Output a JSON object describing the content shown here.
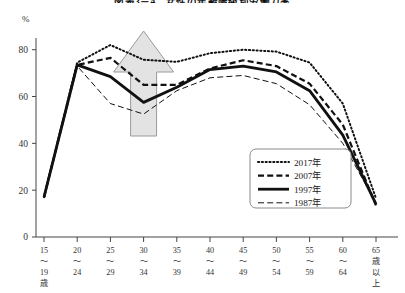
{
  "chart_data": {
    "type": "line",
    "title": "図表3－4　女性の年齢階級別労働力率",
    "ylabel": "%",
    "xlabel": "",
    "ylim": [
      0,
      85
    ],
    "yticks": [
      0,
      20,
      40,
      60,
      80
    ],
    "grid": false,
    "legend_position": "inside-bottom-right",
    "categories": [
      "15\n～\n19\n歳",
      "20\n～\n24",
      "25\n～\n29",
      "30\n～\n34",
      "35\n～\n39",
      "40\n～\n44",
      "45\n～\n49",
      "50\n～\n54",
      "55\n～\n59",
      "60\n～\n64",
      "65\n歳\n以\n上"
    ],
    "series": [
      {
        "name": "2017年",
        "style": "dotted",
        "values": [
          17.0,
          74.5,
          82.0,
          75.7,
          74.8,
          78.5,
          80.0,
          79.2,
          74.5,
          57.0,
          16.5
        ]
      },
      {
        "name": "2007年",
        "style": "dashed",
        "values": [
          17.0,
          73.5,
          76.5,
          65.0,
          65.0,
          72.0,
          75.5,
          73.0,
          65.5,
          48.0,
          13.5
        ]
      },
      {
        "name": "1997年",
        "style": "solid-thick",
        "values": [
          17.0,
          73.5,
          68.5,
          57.5,
          64.0,
          71.5,
          73.0,
          70.5,
          62.5,
          43.5,
          14.0
        ]
      },
      {
        "name": "1987年",
        "style": "thin-dashed",
        "values": [
          17.0,
          73.0,
          57.0,
          52.5,
          62.5,
          68.0,
          69.0,
          65.5,
          56.5,
          40.0,
          14.5
        ]
      }
    ],
    "annotation": {
      "type": "up-arrow",
      "fill": "#e3e3e3",
      "stroke": "#9a9a9a",
      "description": "上向き矢印（M字カーブの底の上昇）"
    }
  },
  "colors": {
    "axis": "#444444",
    "line": "#111111",
    "annotation_fill": "#e4e4e4",
    "annotation_stroke": "#9b9b9b",
    "legend_border": "#8a8a8a",
    "background": "#ffffff"
  }
}
